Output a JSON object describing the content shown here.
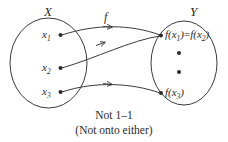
{
  "figure": {
    "type": "function-mapping-diagram",
    "background_color": "#ffffff",
    "stroke_color": "#3a3a3a",
    "domain": {
      "name": "X",
      "elements": [
        {
          "label": "x",
          "subscript": "1"
        },
        {
          "label": "x",
          "subscript": "2"
        },
        {
          "label": "x",
          "subscript": "3"
        }
      ]
    },
    "codomain": {
      "name": "Y",
      "elements": [
        {
          "label": "f(x",
          "subscript": "1",
          "tail": ")",
          "equals": "=",
          "label2": "f(x",
          "subscript2": "2",
          "tail2": ")"
        },
        {
          "label": "f(x",
          "subscript": "3",
          "tail": ")"
        }
      ],
      "unmapped_points": 2
    },
    "map_label": "f",
    "arrows": [
      {
        "from": "x1",
        "to": "f(x1)=f(x2)"
      },
      {
        "from": "x2",
        "to": "f(x1)=f(x2)"
      },
      {
        "from": "x3",
        "to": "f(x3)"
      }
    ],
    "caption": {
      "line1": "Not 1–1",
      "line2": "(Not onto either)"
    }
  }
}
